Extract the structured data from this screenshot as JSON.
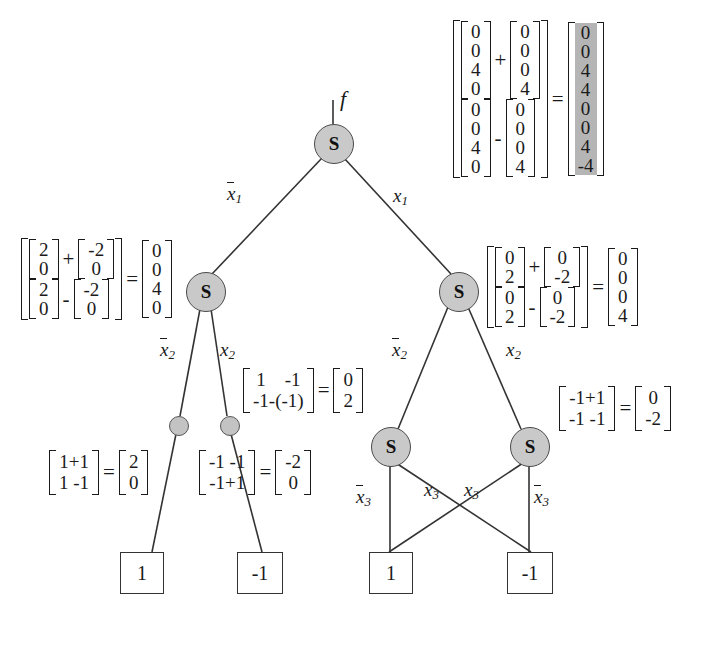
{
  "diagram": {
    "title_label": "f",
    "node_symbol": "S",
    "nodes": {
      "root": {
        "label": "S",
        "x": 333,
        "y": 143,
        "r": 19
      },
      "left2": {
        "label": "S",
        "x": 205,
        "y": 291,
        "r": 19
      },
      "right2": {
        "label": "S",
        "x": 458,
        "y": 291,
        "r": 19
      },
      "dot_left": {
        "x": 178,
        "y": 425,
        "r": 9
      },
      "dot_right": {
        "x": 229,
        "y": 425,
        "r": 9
      },
      "s3_left": {
        "label": "S",
        "x": 390,
        "y": 446,
        "r": 19
      },
      "s3_right": {
        "label": "S",
        "x": 529,
        "y": 446,
        "r": 19
      }
    },
    "terminals": [
      {
        "name": "terminal-left-one",
        "value": "1",
        "x": 141,
        "y": 570
      },
      {
        "name": "terminal-left-negone",
        "value": "-1",
        "x": 252,
        "y": 570
      },
      {
        "name": "terminal-right-one",
        "value": "1",
        "x": 390,
        "y": 570
      },
      {
        "name": "terminal-right-negone",
        "value": "-1",
        "x": 529,
        "y": 570
      }
    ],
    "edge_labels": {
      "x1_bar": "x",
      "x1_bar_sub": "1",
      "x1": "x",
      "x1_sub": "1",
      "x2_bar": "x",
      "x2_bar_sub": "2",
      "x2": "x",
      "x2_sub": "2",
      "x3_bar": "x",
      "x3_bar_sub": "3",
      "x3": "x",
      "x3_sub": "3"
    }
  },
  "expressions": {
    "top_right": {
      "name": "root-vector-equation",
      "lhs": {
        "top": {
          "a": [
            "0",
            "0",
            "4",
            "0"
          ],
          "op": "+",
          "b": [
            "0",
            "0",
            "0",
            "4"
          ]
        },
        "bottom": {
          "a": [
            "0",
            "0",
            "4",
            "0"
          ],
          "op": "-",
          "b": [
            "0",
            "0",
            "0",
            "4"
          ]
        }
      },
      "equals": "=",
      "result": [
        "0",
        "0",
        "4",
        "4",
        "0",
        "0",
        "4",
        "-4"
      ],
      "result_highlighted": true
    },
    "mid_left": {
      "name": "left-node-vector-equation",
      "lhs": {
        "top": {
          "a": [
            "2",
            "0"
          ],
          "op": "+",
          "b": [
            "-2",
            "0"
          ]
        },
        "bottom": {
          "a": [
            "2",
            "0"
          ],
          "op": "-",
          "b": [
            "-2",
            "0"
          ]
        }
      },
      "equals": "=",
      "result": [
        "0",
        "0",
        "4",
        "0"
      ]
    },
    "mid_right": {
      "name": "right-node-vector-equation",
      "lhs": {
        "top": {
          "a": [
            "0",
            "2"
          ],
          "op": "+",
          "b": [
            "0",
            "-2"
          ]
        },
        "bottom": {
          "a": [
            "0",
            "2"
          ],
          "op": "-",
          "b": [
            "0",
            "-2"
          ]
        }
      },
      "equals": "=",
      "result": [
        "0",
        "0",
        "0",
        "4"
      ]
    },
    "center": {
      "name": "center-vector-equation",
      "lhs_rows": [
        "1    -1",
        "-1-(-1)"
      ],
      "equals": "=",
      "result": [
        "0",
        "2"
      ]
    },
    "right_mid2": {
      "name": "right-lower-vector-equation",
      "lhs_rows": [
        "-1+1",
        "-1 -1"
      ],
      "equals": "=",
      "result": [
        "0",
        "-2"
      ]
    },
    "bottom_left": {
      "name": "bottom-left-vector-equation",
      "lhs_rows": [
        "1+1",
        "1 -1"
      ],
      "equals": "=",
      "result": [
        "2",
        "0"
      ]
    },
    "bottom_center": {
      "name": "bottom-center-vector-equation",
      "lhs_rows": [
        "-1 -1",
        "-1+1"
      ],
      "equals": "=",
      "result": [
        "-2",
        "0"
      ]
    }
  },
  "colors": {
    "node_fill": "#c9c9c9",
    "node_stroke": "#4a4a4a",
    "highlight": "#b5b5b5",
    "line": "#333333",
    "text": "#1a1a1a"
  }
}
